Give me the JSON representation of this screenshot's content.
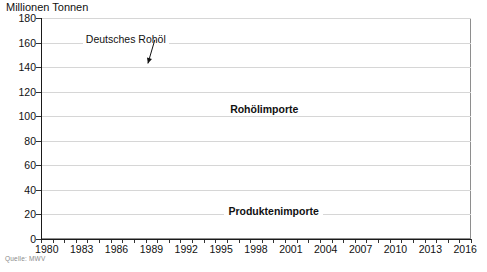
{
  "chart_data": {
    "type": "area",
    "title": "",
    "ylabel": "Millionen Tonnen",
    "xlabel": "",
    "ylim": [
      0,
      180
    ],
    "ytick_values": [
      0,
      20,
      40,
      60,
      80,
      100,
      120,
      140,
      160,
      180
    ],
    "ytick_labels": [
      "0",
      "20",
      "40",
      "60",
      "80",
      "100",
      "120",
      "140",
      "160",
      "180"
    ],
    "grid": true,
    "grid_axis": "y",
    "xlim": [
      1980,
      2017
    ],
    "x": [
      1980,
      1981,
      1982,
      1983,
      1984,
      1985,
      1986,
      1987,
      1988,
      1989,
      1990,
      1991,
      1992,
      1993,
      1994,
      1995,
      1996,
      1997,
      1998,
      1999,
      2000,
      2001,
      2002,
      2003,
      2004,
      2005,
      2006,
      2007,
      2008,
      2009,
      2010,
      2011,
      2012,
      2013,
      2014,
      2015,
      2016,
      2017
    ],
    "xtick_labels": [
      "1980",
      "1983",
      "1986",
      "1989",
      "1992",
      "1995",
      "1998",
      "2001",
      "2004",
      "2007",
      "2010",
      "2013",
      "2016"
    ],
    "xtick_label_values": [
      1980,
      1983,
      1986,
      1989,
      1992,
      1995,
      1998,
      2001,
      2004,
      2007,
      2010,
      2013,
      2016
    ],
    "xtick_every": 1,
    "legend_position": "inline-annotations",
    "series": [
      {
        "name": "Produktenimporte",
        "color": "#e8614a",
        "stack_order": 1,
        "values": [
          34,
          34,
          33,
          33,
          35,
          38,
          40,
          43,
          41,
          38,
          38,
          40,
          44,
          45,
          43,
          44,
          46,
          47,
          47,
          45,
          44,
          43,
          42,
          45,
          45,
          47,
          45,
          44,
          41,
          36,
          40,
          39,
          38,
          36,
          35,
          35,
          36,
          38
        ]
      },
      {
        "name": "Rohölimporte",
        "color": "#ef8b73",
        "stack_order": 2,
        "values": [
          128,
          110,
          96,
          94,
          99,
          99,
          105,
          97,
          98,
          101,
          100,
          97,
          102,
          105,
          108,
          106,
          108,
          110,
          112,
          110,
          107,
          108,
          104,
          103,
          101,
          99,
          99,
          92,
          88,
          85,
          82,
          86,
          87,
          90,
          92,
          94,
          95,
          95
        ]
      },
      {
        "name": "Deutsches Rohöl",
        "color": "#111111",
        "stack_order": 3,
        "values": [
          4,
          4,
          4,
          4,
          4,
          4,
          4,
          4,
          4,
          4,
          3,
          3,
          3,
          3,
          3,
          3,
          3,
          3,
          3,
          3,
          3,
          3,
          4,
          4,
          4,
          4,
          4,
          4,
          4,
          3,
          3,
          3,
          3,
          3,
          3,
          3,
          3,
          3
        ]
      }
    ],
    "total_values": [
      166,
      148,
      133,
      131,
      138,
      141,
      149,
      144,
      143,
      143,
      141,
      140,
      149,
      153,
      154,
      153,
      157,
      160,
      162,
      158,
      154,
      154,
      150,
      152,
      150,
      150,
      148,
      140,
      133,
      124,
      125,
      128,
      128,
      129,
      130,
      132,
      134,
      136
    ],
    "annotations": [
      {
        "text": "Deutsches Rohöl",
        "x": 1983.6,
        "y": 163,
        "arrow_to_x": 1989.2,
        "arrow_to_y": 143
      },
      {
        "text": "Rohölimporte",
        "x": 1999.2,
        "y": 106
      },
      {
        "text": "Produktenimporte",
        "x": 2000.0,
        "y": 23
      }
    ]
  },
  "footer": {
    "source": "Quelle: MWV"
  }
}
